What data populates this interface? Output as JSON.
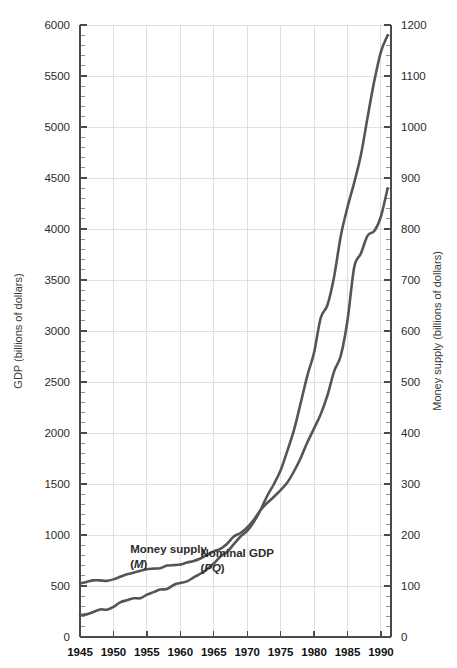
{
  "chart_data": {
    "type": "line",
    "title": "",
    "xlabel": "",
    "ylabel": "GDP (billions of dollars)",
    "y2label": "Money supply (billions of dollars)",
    "xlim": [
      1945,
      1991.5
    ],
    "ylim": [
      0,
      6000
    ],
    "y2lim": [
      0,
      1200
    ],
    "grid": true,
    "legend_position": "inline-annotations",
    "x_tick_labels": [
      "1945",
      "1950",
      "1955",
      "1960",
      "1965",
      "1970",
      "1975",
      "1980",
      "1985",
      "1990"
    ],
    "x_ticks": [
      1945,
      1950,
      1955,
      1960,
      1965,
      1970,
      1975,
      1980,
      1985,
      1990
    ],
    "y_tick_labels": [
      "0",
      "500",
      "1000",
      "1500",
      "2000",
      "2500",
      "3000",
      "3500",
      "4000",
      "4500",
      "5000",
      "5500",
      "6000"
    ],
    "y_ticks": [
      0,
      500,
      1000,
      1500,
      2000,
      2500,
      3000,
      3500,
      4000,
      4500,
      5000,
      5500,
      6000
    ],
    "y_minor_step": 100,
    "y2_tick_labels": [
      "0",
      "100",
      "200",
      "300",
      "400",
      "500",
      "600",
      "700",
      "800",
      "900",
      "1000",
      "1100",
      "1200"
    ],
    "y2_ticks": [
      0,
      100,
      200,
      300,
      400,
      500,
      600,
      700,
      800,
      900,
      1000,
      1100,
      1200
    ],
    "y2_minor_step": 20,
    "line_color": "#555555",
    "grid_color": "#d8d8d8",
    "axis_color": "#4a4a4a",
    "x": [
      1945,
      1946,
      1947,
      1948,
      1949,
      1950,
      1951,
      1952,
      1953,
      1954,
      1955,
      1956,
      1957,
      1958,
      1959,
      1960,
      1961,
      1962,
      1963,
      1964,
      1965,
      1966,
      1967,
      1968,
      1969,
      1970,
      1971,
      1972,
      1973,
      1974,
      1975,
      1976,
      1977,
      1978,
      1979,
      1980,
      1981,
      1982,
      1983,
      1984,
      1985,
      1986,
      1987,
      1988,
      1989,
      1990,
      1991
    ],
    "series": [
      {
        "name": "Nominal GDP",
        "symbol": "PQ",
        "axis": "left",
        "unit": "billions of dollars",
        "values": [
          215,
          222,
          245,
          270,
          268,
          295,
          340,
          360,
          380,
          380,
          415,
          440,
          465,
          470,
          510,
          530,
          545,
          585,
          620,
          665,
          720,
          790,
          835,
          910,
          985,
          1040,
          1130,
          1245,
          1385,
          1500,
          1635,
          1825,
          2030,
          2295,
          2565,
          2790,
          3130,
          3255,
          3535,
          3935,
          4215,
          4455,
          4725,
          5095,
          5450,
          5740,
          5900
        ]
      },
      {
        "name": "Money supply",
        "symbol": "M",
        "axis": "right",
        "unit": "billions of dollars",
        "values": [
          105,
          108,
          111,
          111,
          110,
          113,
          118,
          123,
          126,
          130,
          133,
          134,
          135,
          140,
          141,
          142,
          146,
          149,
          154,
          161,
          168,
          173,
          183,
          197,
          204,
          215,
          230,
          249,
          263,
          275,
          288,
          303,
          325,
          351,
          382,
          409,
          437,
          474,
          521,
          552,
          621,
          725,
          752,
          787,
          796,
          825,
          880
        ]
      }
    ],
    "annotations": [
      {
        "text": "Money supply",
        "symbol": "M",
        "x": 1952.5,
        "y_right": 165
      },
      {
        "text": "Nominal GDP",
        "symbol": "PQ",
        "x": 1963,
        "y_left": 780
      }
    ]
  }
}
